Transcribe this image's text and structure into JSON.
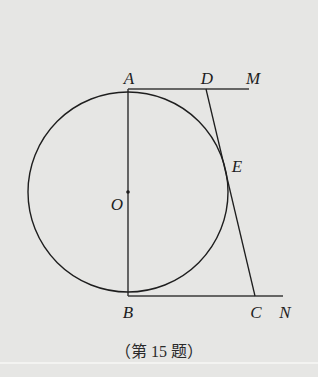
{
  "figure": {
    "caption": "（第 15 题）",
    "labels": {
      "A": "A",
      "D": "D",
      "M": "M",
      "E": "E",
      "O": "O",
      "B": "B",
      "C": "C",
      "N": "N"
    },
    "colors": {
      "background": "#e6e6e4",
      "stroke": "#1e1e1e"
    }
  }
}
